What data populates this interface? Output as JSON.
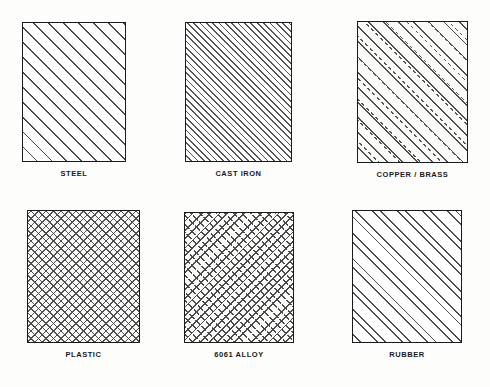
{
  "sheet": {
    "background_color": "#fdfdfb",
    "line_color": "#1b1b1b",
    "columns": 3,
    "rows": 2
  },
  "chart_data": {
    "type": "table",
    "title": "",
    "xlabel": "",
    "ylabel": "",
    "legend_position": "below-each-swatch",
    "grid": false,
    "categories": [
      "STEEL",
      "CAST IRON",
      "COPPER / BRASS",
      "PLASTIC",
      "6061 ALLOY",
      "RUBBER"
    ],
    "values": [
      "wide-spaced solid 45 degree diagonal hatch",
      "tight solid 45 degree diagonal hatch",
      "alternating solid and dashed 45 degree diagonal hatch",
      "fine uniform crosshatch, both diagonals",
      "dense dashed crosshatch, both diagonals",
      "paired 45 degree diagonal lines with wide gaps"
    ]
  },
  "swatches": [
    {
      "label": "STEEL",
      "pattern": "hatch-steel",
      "row": 1,
      "column": 1,
      "x": 22,
      "y": 22,
      "width": 104,
      "height": 140
    },
    {
      "label": "CAST IRON",
      "pattern": "hatch-cast-iron",
      "row": 1,
      "column": 2,
      "x": 185,
      "y": 22,
      "width": 107,
      "height": 140
    },
    {
      "label": "COPPER / BRASS",
      "pattern": "hatch-copper-brass",
      "row": 1,
      "column": 3,
      "x": 357,
      "y": 21,
      "width": 111,
      "height": 142
    },
    {
      "label": "PLASTIC",
      "pattern": "hatch-plastic",
      "row": 2,
      "column": 1,
      "x": 27,
      "y": 210,
      "width": 113,
      "height": 133
    },
    {
      "label": "6061 ALLOY",
      "pattern": "hatch-alloy",
      "row": 2,
      "column": 2,
      "x": 184,
      "y": 212,
      "width": 110,
      "height": 131
    },
    {
      "label": "RUBBER",
      "pattern": "hatch-rubber",
      "row": 2,
      "column": 3,
      "x": 352,
      "y": 210,
      "width": 110,
      "height": 133
    }
  ]
}
